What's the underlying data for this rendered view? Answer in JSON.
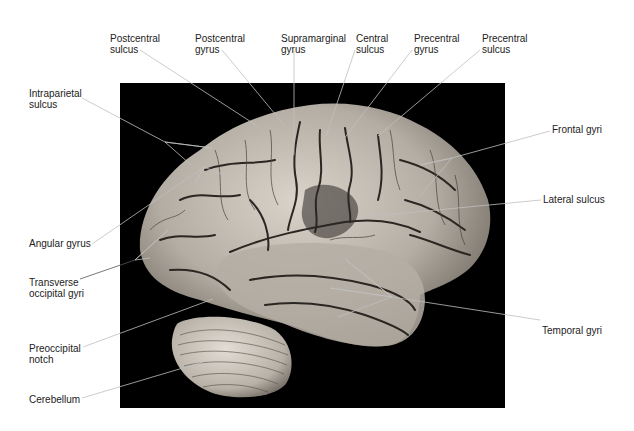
{
  "figure": {
    "background_color": "#000000",
    "photo_box": {
      "x": 120,
      "y": 83,
      "width": 385,
      "height": 325
    }
  },
  "labels": [
    {
      "id": "postcentral-sulcus",
      "text": "Postcentral\nsulcus",
      "x": 110,
      "y": 33,
      "line": [
        [
          140,
          50
        ],
        [
          262,
          129
        ]
      ]
    },
    {
      "id": "postcentral-gyrus",
      "text": "Postcentral\ngyrus",
      "x": 195,
      "y": 33,
      "line": [
        [
          222,
          50
        ],
        [
          285,
          126
        ]
      ]
    },
    {
      "id": "supramarginal-gyrus",
      "text": "Supramarginal\ngyrus",
      "x": 281,
      "y": 33,
      "line": [
        [
          294,
          50
        ],
        [
          294,
          155
        ]
      ]
    },
    {
      "id": "central-sulcus",
      "text": "Central\nsulcus",
      "x": 356,
      "y": 33,
      "line": [
        [
          355,
          50
        ],
        [
          326,
          136
        ]
      ]
    },
    {
      "id": "precentral-gyrus",
      "text": "Precentral\ngyrus",
      "x": 414,
      "y": 33,
      "line": [
        [
          412,
          50
        ],
        [
          343,
          140
        ]
      ]
    },
    {
      "id": "precentral-sulcus",
      "text": "Precentral\nsulcus",
      "x": 482,
      "y": 33,
      "line": [
        [
          480,
          50
        ],
        [
          378,
          136
        ]
      ]
    },
    {
      "id": "intraparietal-sulcus",
      "text": "Intraparietal\nsulcus",
      "x": 29,
      "y": 88,
      "line": [
        [
          82,
          98
        ],
        [
          165,
          142
        ],
        [
          212,
          148
        ],
        [
          165,
          142
        ],
        [
          191,
          165
        ]
      ]
    },
    {
      "id": "frontal-gyri",
      "text": "Frontal gyri",
      "x": 552,
      "y": 124,
      "line": [
        [
          550,
          131
        ],
        [
          452,
          158
        ],
        [
          420,
          165
        ],
        [
          452,
          158
        ],
        [
          420,
          196
        ]
      ]
    },
    {
      "id": "lateral-sulcus",
      "text": "Lateral sulcus",
      "x": 543,
      "y": 193,
      "line": [
        [
          541,
          200
        ],
        [
          364,
          217
        ]
      ]
    },
    {
      "id": "angular-gyrus",
      "text": "Angular gyrus",
      "x": 29,
      "y": 237,
      "line": [
        [
          92,
          244
        ],
        [
          204,
          167
        ],
        [
          195,
          183
        ],
        [
          204,
          167
        ],
        [
          224,
          175
        ]
      ]
    },
    {
      "id": "transverse-occipital-gyri",
      "text": "Transverse\noccipital gyri",
      "x": 29,
      "y": 277,
      "line": [
        [
          80,
          279
        ],
        [
          135,
          260
        ],
        [
          168,
          230
        ],
        [
          135,
          260
        ],
        [
          150,
          258
        ]
      ]
    },
    {
      "id": "temporal-gyri",
      "text": "Temporal gyri",
      "x": 542,
      "y": 323,
      "line": [
        [
          540,
          320
        ],
        [
          392,
          297
        ],
        [
          345,
          259
        ],
        [
          392,
          297
        ],
        [
          330,
          288
        ],
        [
          392,
          297
        ],
        [
          338,
          317
        ]
      ]
    },
    {
      "id": "preoccipital-notch",
      "text": "Preoccipital\nnotch",
      "x": 29,
      "y": 343,
      "line": [
        [
          83,
          347
        ],
        [
          213,
          299
        ]
      ]
    },
    {
      "id": "cerebellum",
      "text": "Cerebellum",
      "x": 29,
      "y": 392,
      "line": [
        [
          82,
          398
        ],
        [
          203,
          362
        ]
      ]
    }
  ],
  "colors": {
    "label_text": "#222222",
    "leader_line": "#555555",
    "leader_line_on_photo": "#bfbfbf",
    "brain_fill": "#bdb6ad",
    "sulcus": "#2a2622"
  }
}
